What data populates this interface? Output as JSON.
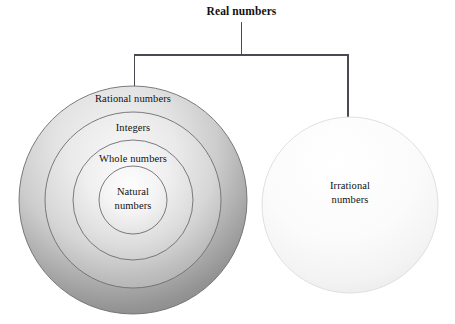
{
  "diagram": {
    "title": "Real numbers",
    "type": "nested-set-venn-diagram",
    "background_color": "#ffffff",
    "text_color": "#111111",
    "connector": {
      "line_color": "#4a4a52",
      "stem_label": "Real numbers",
      "branch_count": 2
    },
    "branches": [
      {
        "target": "rational-numbers-circle",
        "label": "Rational numbers"
      },
      {
        "target": "irrational-numbers-circle",
        "label": "Irrational numbers"
      }
    ],
    "left_group": {
      "name": "rational-nested-circles",
      "fill_light": "#f2f2f2",
      "fill_dark": "#8f8f8f",
      "stroke_color": "#6a6a70",
      "rings": [
        {
          "id": "rational",
          "label": "Rational numbers",
          "level": 1
        },
        {
          "id": "integers",
          "label": "Integers",
          "level": 2
        },
        {
          "id": "whole",
          "label": "Whole numbers",
          "level": 3
        },
        {
          "id": "natural",
          "label_line1": "Natural",
          "label_line2": "numbers",
          "level": 4
        }
      ]
    },
    "right_group": {
      "name": "irrational-circle",
      "label_line1": "Irrational",
      "label_line2": "numbers",
      "fill_light": "#ffffff",
      "fill_dark": "#ececed",
      "stroke_color": "#d8d8da"
    }
  }
}
